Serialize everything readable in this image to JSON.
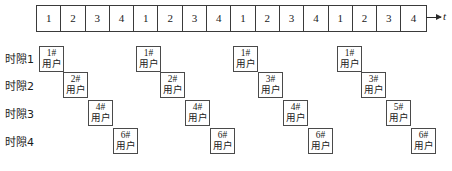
{
  "figure": {
    "axis_label": "t",
    "axis_arrow": "right-arrow"
  },
  "timeline": {
    "cells": [
      "1",
      "2",
      "3",
      "4",
      "1",
      "2",
      "3",
      "4",
      "1",
      "2",
      "3",
      "4",
      "1",
      "2",
      "3",
      "4"
    ],
    "frames": 4,
    "slots_per_frame": 4
  },
  "rows": [
    {
      "label": "时隙1",
      "label_top": 50,
      "box_top": 46,
      "boxes": [
        {
          "id": "1#",
          "word": "用户",
          "left": 39
        },
        {
          "id": "1#",
          "word": "用户",
          "left": 136
        },
        {
          "id": "1#",
          "word": "用户",
          "left": 233
        },
        {
          "id": "1#",
          "word": "用户",
          "left": 337
        }
      ]
    },
    {
      "label": "时隙2",
      "label_top": 77,
      "box_top": 72,
      "boxes": [
        {
          "id": "2#",
          "word": "用户",
          "left": 63
        },
        {
          "id": "2#",
          "word": "用户",
          "left": 160
        },
        {
          "id": "3#",
          "word": "用户",
          "left": 258
        },
        {
          "id": "3#",
          "word": "用户",
          "left": 361
        }
      ]
    },
    {
      "label": "时隙3",
      "label_top": 105,
      "box_top": 100,
      "boxes": [
        {
          "id": "4#",
          "word": "用户",
          "left": 88
        },
        {
          "id": "4#",
          "word": "用户",
          "left": 185
        },
        {
          "id": "4#",
          "word": "用户",
          "left": 283
        },
        {
          "id": "5#",
          "word": "用户",
          "left": 386
        }
      ]
    },
    {
      "label": "时隙4",
      "label_top": 133,
      "box_top": 128,
      "boxes": [
        {
          "id": "6#",
          "word": "用户",
          "left": 113
        },
        {
          "id": "6#",
          "word": "用户",
          "left": 210
        },
        {
          "id": "6#",
          "word": "用户",
          "left": 308
        },
        {
          "id": "6#",
          "word": "用户",
          "left": 411
        }
      ]
    }
  ]
}
